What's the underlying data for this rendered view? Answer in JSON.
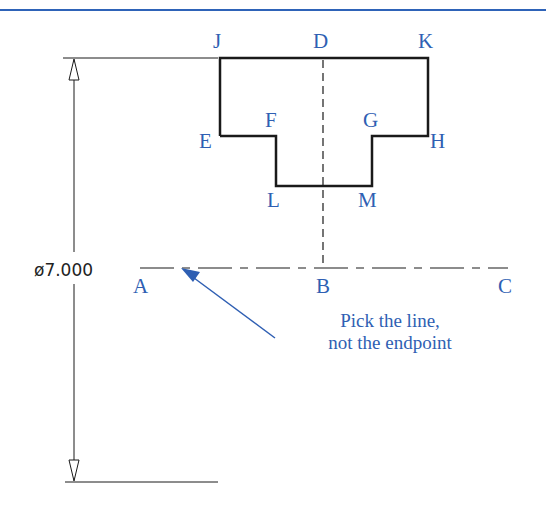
{
  "colors": {
    "accent": "#2f5fb3",
    "line": "#1a1a1a",
    "header_rule": "#2e63b8"
  },
  "points": {
    "J": "J",
    "D": "D",
    "K": "K",
    "E": "E",
    "F": "F",
    "G": "G",
    "H": "H",
    "L": "L",
    "M": "M",
    "A": "A",
    "B": "B",
    "C": "C"
  },
  "dimension": {
    "label": "ø7.000"
  },
  "annotation": {
    "line1": "Pick the line,",
    "line2": "not the endpoint"
  }
}
